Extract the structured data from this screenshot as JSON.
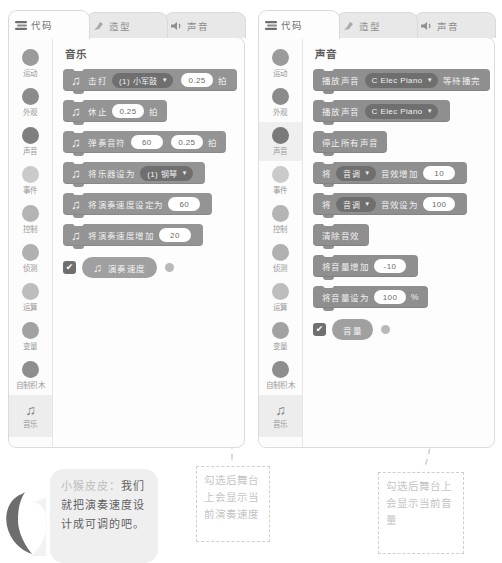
{
  "colors": {
    "block_music": "#949494",
    "block_sound": "#8f8f8f",
    "dropdown": "#6f6f6f",
    "panel_bg": "#fdfdfd",
    "annotation": "#cfcfcf"
  },
  "panels": [
    {
      "id": "left",
      "tabs": [
        {
          "label": "代码",
          "icon": "code-icon",
          "active": true
        },
        {
          "label": "造型",
          "icon": "paintbrush-icon",
          "active": false
        },
        {
          "label": "声音",
          "icon": "speaker-icon",
          "active": false
        }
      ],
      "categories": [
        {
          "label": "运动",
          "color": "#9b9b9b",
          "selected": false
        },
        {
          "label": "外观",
          "color": "#8b8b8b",
          "selected": false
        },
        {
          "label": "声音",
          "color": "#7f7f7f",
          "selected": false
        },
        {
          "label": "事件",
          "color": "#cacaca",
          "selected": false
        },
        {
          "label": "控制",
          "color": "#b4b4b4",
          "selected": false
        },
        {
          "label": "侦测",
          "color": "#b0b0b0",
          "selected": false
        },
        {
          "label": "运算",
          "color": "#bdbdbd",
          "selected": false
        },
        {
          "label": "变量",
          "color": "#a2a2a2",
          "selected": false
        },
        {
          "label": "自制积木",
          "color": "#8e8e8e",
          "selected": false
        }
      ],
      "music_category": {
        "label": "音乐",
        "icon": "music-note-icon"
      },
      "palette_title": "音乐",
      "blocks": [
        {
          "parts": [
            {
              "type": "icon",
              "value": "music-note-icon"
            },
            {
              "type": "text",
              "value": "击打"
            },
            {
              "type": "dropdown",
              "value": "(1) 小军鼓"
            },
            {
              "type": "pill",
              "value": "0.25"
            },
            {
              "type": "text",
              "value": "拍"
            }
          ]
        },
        {
          "parts": [
            {
              "type": "icon",
              "value": "music-note-icon"
            },
            {
              "type": "text",
              "value": "休止"
            },
            {
              "type": "pill",
              "value": "0.25"
            },
            {
              "type": "text",
              "value": "拍"
            }
          ]
        },
        {
          "parts": [
            {
              "type": "icon",
              "value": "music-note-icon"
            },
            {
              "type": "text",
              "value": "弹奏音符"
            },
            {
              "type": "pill",
              "value": "60"
            },
            {
              "type": "pill",
              "value": "0.25"
            },
            {
              "type": "text",
              "value": "拍"
            }
          ]
        },
        {
          "parts": [
            {
              "type": "icon",
              "value": "music-note-icon"
            },
            {
              "type": "text",
              "value": "将乐器设为"
            },
            {
              "type": "dropdown",
              "value": "(1) 钢琴"
            }
          ]
        },
        {
          "parts": [
            {
              "type": "icon",
              "value": "music-note-icon"
            },
            {
              "type": "text",
              "value": "将演奏速度设定为"
            },
            {
              "type": "pill",
              "value": "60"
            }
          ]
        },
        {
          "parts": [
            {
              "type": "icon",
              "value": "music-note-icon"
            },
            {
              "type": "text",
              "value": "将演奏速度增加"
            },
            {
              "type": "pill",
              "value": "20"
            }
          ]
        }
      ],
      "reporter": {
        "checked": true,
        "check_glyph": "✔",
        "icon": "music-note-icon",
        "label": "演奏速度"
      }
    },
    {
      "id": "right",
      "tabs": [
        {
          "label": "代码",
          "icon": "code-icon",
          "active": true
        },
        {
          "label": "造型",
          "icon": "paintbrush-icon",
          "active": false
        },
        {
          "label": "声音",
          "icon": "speaker-icon",
          "active": false
        }
      ],
      "categories": [
        {
          "label": "运动",
          "color": "#9b9b9b",
          "selected": false
        },
        {
          "label": "外观",
          "color": "#8b8b8b",
          "selected": false
        },
        {
          "label": "声音",
          "color": "#7a7a7a",
          "selected": true
        },
        {
          "label": "事件",
          "color": "#cacaca",
          "selected": false
        },
        {
          "label": "控制",
          "color": "#b4b4b4",
          "selected": false
        },
        {
          "label": "侦测",
          "color": "#b0b0b0",
          "selected": false
        },
        {
          "label": "运算",
          "color": "#bdbdbd",
          "selected": false
        },
        {
          "label": "变量",
          "color": "#a2a2a2",
          "selected": false
        },
        {
          "label": "自制积木",
          "color": "#8e8e8e",
          "selected": false
        }
      ],
      "music_category": {
        "label": "音乐",
        "icon": "music-note-icon"
      },
      "palette_title": "声音",
      "blocks": [
        {
          "parts": [
            {
              "type": "text",
              "value": "播放声音"
            },
            {
              "type": "dropdown",
              "value": "C Elec Piano"
            },
            {
              "type": "text",
              "value": "等待播完"
            }
          ]
        },
        {
          "parts": [
            {
              "type": "text",
              "value": "播放声音"
            },
            {
              "type": "dropdown",
              "value": "C Elec Piano"
            }
          ]
        },
        {
          "parts": [
            {
              "type": "text",
              "value": "停止所有声音"
            }
          ]
        },
        {
          "parts": [
            {
              "type": "text",
              "value": "将"
            },
            {
              "type": "dropdown",
              "value": "音调"
            },
            {
              "type": "text",
              "value": "音效增加"
            },
            {
              "type": "pill",
              "value": "10"
            }
          ]
        },
        {
          "parts": [
            {
              "type": "text",
              "value": "将"
            },
            {
              "type": "dropdown",
              "value": "音调"
            },
            {
              "type": "text",
              "value": "音效设为"
            },
            {
              "type": "pill",
              "value": "100"
            }
          ]
        },
        {
          "parts": [
            {
              "type": "text",
              "value": "清除音效"
            }
          ]
        },
        {
          "parts": [
            {
              "type": "text",
              "value": "将音量增加"
            },
            {
              "type": "pill",
              "value": "-10"
            }
          ]
        },
        {
          "parts": [
            {
              "type": "text",
              "value": "将音量设为"
            },
            {
              "type": "pill",
              "value": "100"
            },
            {
              "type": "text",
              "value": "%"
            }
          ]
        }
      ],
      "reporter": {
        "checked": true,
        "check_glyph": "✔",
        "icon": "",
        "label": "音量"
      }
    }
  ],
  "annotations": {
    "tempo_callout": "勾选后舞台上会显示当前演奏速度",
    "volume_callout": "勾选后舞台上会显示当前音量"
  },
  "speech_bubble": {
    "speaker": "小猴皮皮：",
    "text": "我们就把演奏速度设计成可调的吧。",
    "full": "小猴皮皮：我们就把演奏速度设计成可调的吧。"
  }
}
